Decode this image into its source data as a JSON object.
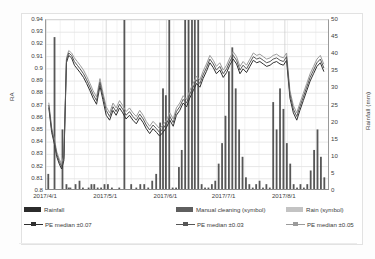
{
  "chart_data": {
    "type": "line",
    "title": "",
    "subtitle": "",
    "xlabel": "",
    "ylabel": "RA",
    "y2label": "Rainfall (mm)",
    "grid": true,
    "legend_position": "bottom",
    "ylim": [
      0.8,
      0.94
    ],
    "y2lim": [
      0,
      50
    ],
    "ytick_labels": [
      "0.94",
      "0.93",
      "0.92",
      "0.91",
      "0.9",
      "0.89",
      "0.88",
      "0.87",
      "0.86",
      "0.85",
      "0.84",
      "0.83",
      "0.82",
      "0.81",
      "0.8"
    ],
    "ytick_values": [
      0.94,
      0.93,
      0.92,
      0.91,
      0.9,
      0.89,
      0.88,
      0.87,
      0.86,
      0.85,
      0.84,
      0.83,
      0.82,
      0.81,
      0.8
    ],
    "y2tick_labels": [
      "50",
      "45",
      "40",
      "35",
      "30",
      "25",
      "20",
      "15",
      "10",
      "5",
      "0"
    ],
    "y2tick_values": [
      50,
      45,
      40,
      35,
      30,
      25,
      20,
      15,
      10,
      5,
      0
    ],
    "xtick_labels": [
      "2017/4/1",
      "2017/5/1",
      "2017/6/1",
      "2017/7/1",
      "2017/8/1"
    ],
    "xtick_positions": [
      0.0,
      0.212,
      0.424,
      0.629,
      0.841
    ],
    "x_range": [
      "2017/4/1",
      "2017/9/1"
    ],
    "series": [
      {
        "name": "PE median ±0.07",
        "axis": "left",
        "color": "#2f2f2f",
        "x": [
          0.01,
          0.02,
          0.03,
          0.038,
          0.047,
          0.055,
          0.063,
          0.072,
          0.08,
          0.09,
          0.1,
          0.11,
          0.12,
          0.132,
          0.143,
          0.155,
          0.166,
          0.178,
          0.19,
          0.2,
          0.212,
          0.224,
          0.236,
          0.247,
          0.259,
          0.27,
          0.282,
          0.294,
          0.306,
          0.318,
          0.33,
          0.342,
          0.353,
          0.365,
          0.377,
          0.389,
          0.4,
          0.412,
          0.424,
          0.436,
          0.448,
          0.459,
          0.471,
          0.483,
          0.495,
          0.506,
          0.518,
          0.53,
          0.542,
          0.553,
          0.565,
          0.577,
          0.589,
          0.6,
          0.612,
          0.624,
          0.636,
          0.647,
          0.659,
          0.671,
          0.683,
          0.694,
          0.706,
          0.718,
          0.73,
          0.742,
          0.753,
          0.765,
          0.777,
          0.789,
          0.8,
          0.812,
          0.824,
          0.836,
          0.847,
          0.859,
          0.871,
          0.883,
          0.894,
          0.906,
          0.918,
          0.93,
          0.942,
          0.954,
          0.966,
          0.978
        ],
        "values": [
          0.868,
          0.848,
          0.838,
          0.828,
          0.822,
          0.818,
          0.825,
          0.905,
          0.911,
          0.909,
          0.903,
          0.9,
          0.897,
          0.893,
          0.888,
          0.882,
          0.876,
          0.871,
          0.886,
          0.875,
          0.862,
          0.858,
          0.866,
          0.862,
          0.868,
          0.864,
          0.859,
          0.862,
          0.858,
          0.855,
          0.86,
          0.856,
          0.851,
          0.847,
          0.851,
          0.848,
          0.845,
          0.848,
          0.852,
          0.858,
          0.853,
          0.862,
          0.866,
          0.872,
          0.869,
          0.876,
          0.882,
          0.888,
          0.885,
          0.892,
          0.898,
          0.905,
          0.901,
          0.896,
          0.899,
          0.893,
          0.897,
          0.903,
          0.908,
          0.904,
          0.896,
          0.9,
          0.897,
          0.902,
          0.907,
          0.905,
          0.906,
          0.904,
          0.902,
          0.903,
          0.905,
          0.906,
          0.904,
          0.903,
          0.907,
          0.876,
          0.864,
          0.858,
          0.866,
          0.874,
          0.882,
          0.89,
          0.896,
          0.902,
          0.905,
          0.898
        ]
      },
      {
        "name": "PE median ±0.03",
        "axis": "left",
        "color": "#565656",
        "x": [
          0.01,
          0.02,
          0.03,
          0.038,
          0.047,
          0.055,
          0.063,
          0.072,
          0.08,
          0.09,
          0.1,
          0.11,
          0.12,
          0.132,
          0.143,
          0.155,
          0.166,
          0.178,
          0.19,
          0.2,
          0.212,
          0.224,
          0.236,
          0.247,
          0.259,
          0.27,
          0.282,
          0.294,
          0.306,
          0.318,
          0.33,
          0.342,
          0.353,
          0.365,
          0.377,
          0.389,
          0.4,
          0.412,
          0.424,
          0.436,
          0.448,
          0.459,
          0.471,
          0.483,
          0.495,
          0.506,
          0.518,
          0.53,
          0.542,
          0.553,
          0.565,
          0.577,
          0.589,
          0.6,
          0.612,
          0.624,
          0.636,
          0.647,
          0.659,
          0.671,
          0.683,
          0.694,
          0.706,
          0.718,
          0.73,
          0.742,
          0.753,
          0.765,
          0.777,
          0.789,
          0.8,
          0.812,
          0.824,
          0.836,
          0.847,
          0.859,
          0.871,
          0.883,
          0.894,
          0.906,
          0.918,
          0.93,
          0.942,
          0.954,
          0.966,
          0.978
        ],
        "values": [
          0.87,
          0.85,
          0.84,
          0.83,
          0.824,
          0.82,
          0.827,
          0.907,
          0.913,
          0.911,
          0.906,
          0.903,
          0.9,
          0.896,
          0.891,
          0.885,
          0.879,
          0.874,
          0.889,
          0.878,
          0.866,
          0.861,
          0.869,
          0.865,
          0.871,
          0.867,
          0.862,
          0.865,
          0.861,
          0.858,
          0.863,
          0.859,
          0.854,
          0.85,
          0.854,
          0.851,
          0.848,
          0.851,
          0.855,
          0.861,
          0.856,
          0.865,
          0.869,
          0.875,
          0.872,
          0.879,
          0.885,
          0.891,
          0.888,
          0.895,
          0.901,
          0.908,
          0.904,
          0.899,
          0.902,
          0.896,
          0.9,
          0.906,
          0.911,
          0.907,
          0.899,
          0.903,
          0.9,
          0.905,
          0.91,
          0.908,
          0.909,
          0.907,
          0.905,
          0.906,
          0.908,
          0.909,
          0.907,
          0.906,
          0.91,
          0.879,
          0.867,
          0.861,
          0.869,
          0.877,
          0.885,
          0.893,
          0.899,
          0.905,
          0.908,
          0.901
        ]
      },
      {
        "name": "PE median ±0.05",
        "axis": "left",
        "color": "#9b9b9b",
        "x": [
          0.01,
          0.02,
          0.03,
          0.038,
          0.047,
          0.055,
          0.063,
          0.072,
          0.08,
          0.09,
          0.1,
          0.11,
          0.12,
          0.132,
          0.143,
          0.155,
          0.166,
          0.178,
          0.19,
          0.2,
          0.212,
          0.224,
          0.236,
          0.247,
          0.259,
          0.27,
          0.282,
          0.294,
          0.306,
          0.318,
          0.33,
          0.342,
          0.353,
          0.365,
          0.377,
          0.389,
          0.4,
          0.412,
          0.424,
          0.436,
          0.448,
          0.459,
          0.471,
          0.483,
          0.495,
          0.506,
          0.518,
          0.53,
          0.542,
          0.553,
          0.565,
          0.577,
          0.589,
          0.6,
          0.612,
          0.624,
          0.636,
          0.647,
          0.659,
          0.671,
          0.683,
          0.694,
          0.706,
          0.718,
          0.73,
          0.742,
          0.753,
          0.765,
          0.777,
          0.789,
          0.8,
          0.812,
          0.824,
          0.836,
          0.847,
          0.859,
          0.871,
          0.883,
          0.894,
          0.906,
          0.918,
          0.93,
          0.942,
          0.954,
          0.966,
          0.978
        ],
        "values": [
          0.872,
          0.852,
          0.842,
          0.832,
          0.826,
          0.822,
          0.829,
          0.909,
          0.915,
          0.913,
          0.909,
          0.906,
          0.903,
          0.899,
          0.894,
          0.888,
          0.882,
          0.877,
          0.892,
          0.881,
          0.869,
          0.864,
          0.872,
          0.868,
          0.874,
          0.87,
          0.865,
          0.868,
          0.864,
          0.861,
          0.866,
          0.862,
          0.857,
          0.853,
          0.857,
          0.854,
          0.851,
          0.854,
          0.858,
          0.864,
          0.859,
          0.868,
          0.872,
          0.878,
          0.875,
          0.882,
          0.888,
          0.894,
          0.891,
          0.898,
          0.904,
          0.911,
          0.907,
          0.902,
          0.905,
          0.899,
          0.903,
          0.909,
          0.914,
          0.91,
          0.902,
          0.906,
          0.903,
          0.908,
          0.913,
          0.911,
          0.912,
          0.91,
          0.908,
          0.909,
          0.911,
          0.912,
          0.91,
          0.909,
          0.913,
          0.882,
          0.87,
          0.864,
          0.872,
          0.88,
          0.888,
          0.896,
          0.902,
          0.908,
          0.911,
          0.904
        ]
      }
    ],
    "rainfall": {
      "name": "Rainfall",
      "axis": "right",
      "color": "#3a3a3a",
      "unit": "mm",
      "x": [
        0.008,
        0.03,
        0.058,
        0.072,
        0.08,
        0.086,
        0.104,
        0.118,
        0.13,
        0.15,
        0.16,
        0.17,
        0.182,
        0.194,
        0.206,
        0.218,
        0.232,
        0.258,
        0.276,
        0.3,
        0.318,
        0.332,
        0.346,
        0.36,
        0.374,
        0.388,
        0.402,
        0.412,
        0.422,
        0.434,
        0.446,
        0.458,
        0.468,
        0.478,
        0.49,
        0.502,
        0.514,
        0.524,
        0.536,
        0.548,
        0.56,
        0.572,
        0.584,
        0.596,
        0.608,
        0.62,
        0.632,
        0.644,
        0.656,
        0.668,
        0.68,
        0.692,
        0.704,
        0.716,
        0.728,
        0.74,
        0.752,
        0.764,
        0.776,
        0.788,
        0.8,
        0.812,
        0.824,
        0.836,
        0.848,
        0.86,
        0.872,
        0.884,
        0.896,
        0.908,
        0.92,
        0.932,
        0.944,
        0.956,
        0.968,
        0.98
      ],
      "values": [
        5,
        45,
        18,
        2,
        1,
        1,
        2,
        3,
        1,
        1,
        2,
        2,
        1,
        1,
        2,
        2,
        1,
        1,
        50,
        2,
        1,
        2,
        2,
        1,
        3,
        5,
        20,
        30,
        28,
        50,
        1,
        1,
        7,
        12,
        50,
        50,
        50,
        50,
        50,
        2,
        1,
        1,
        2,
        3,
        8,
        14,
        22,
        35,
        42,
        30,
        18,
        10,
        4,
        2,
        1,
        2,
        3,
        1,
        2,
        1,
        26,
        18,
        30,
        24,
        14,
        8,
        2,
        1,
        2,
        1,
        2,
        6,
        12,
        18,
        10,
        4
      ]
    },
    "markers": [
      {
        "name": "Manual cleaning (symbol)",
        "color": "#5a5a5a"
      },
      {
        "name": "Rain (symbol)",
        "color": "#bdbdbd"
      }
    ]
  },
  "legend": {
    "row1": [
      {
        "label": "Rainfall",
        "style": "bar",
        "color": "#2b2b2b"
      },
      {
        "label": "Manual cleaning (symbol)",
        "style": "bar",
        "color": "#5f5f5f"
      },
      {
        "label": "Rain (symbol)",
        "style": "bar",
        "color": "#c3c3c3"
      }
    ],
    "row2": [
      {
        "label": "PE median ±0.07",
        "style": "line",
        "color": "#2f2f2f"
      },
      {
        "label": "PE median ±0.03",
        "style": "line",
        "color": "#565656"
      },
      {
        "label": "PE median ±0.05",
        "style": "line",
        "color": "#9b9b9b"
      }
    ]
  }
}
